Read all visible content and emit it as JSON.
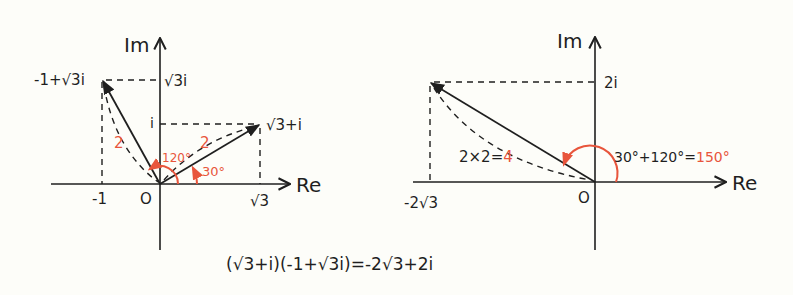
{
  "colors": {
    "ink": "#1f1f1f",
    "accent": "#e8553c",
    "background": "#fdfdf9"
  },
  "left_diagram": {
    "axis_im": "Im",
    "axis_re": "Re",
    "origin": "O",
    "point_a_label": "-1+√3i",
    "point_b_label": "√3+i",
    "tick_im_sqrt3": "√3i",
    "tick_im_i": "i",
    "tick_re_neg1": "-1",
    "tick_re_sqrt3": "√3",
    "length_a": "2",
    "length_b": "2",
    "angle_a": "120°",
    "angle_b": "30°"
  },
  "right_diagram": {
    "axis_im": "Im",
    "axis_re": "Re",
    "origin": "O",
    "tick_im_2i": "2i",
    "tick_re": "-2√3",
    "length_expr": "2×2=",
    "length_result": "4",
    "angle_expr": "30°+120°=",
    "angle_result": "150°"
  },
  "equation": "(√3+i)(-1+√3i)=-2√3+2i"
}
